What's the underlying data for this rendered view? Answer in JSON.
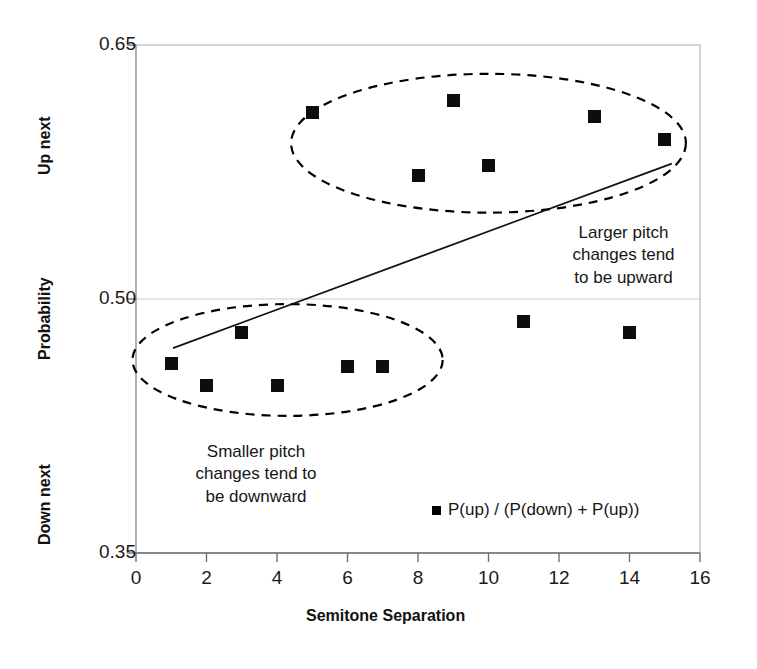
{
  "chart_data": {
    "type": "scatter",
    "title": "",
    "xlabel": "Semitone Separation",
    "ylabel": "Probability",
    "xlim": [
      0,
      16
    ],
    "ylim": [
      0.35,
      0.65
    ],
    "xticks": [
      "0",
      "2",
      "4",
      "6",
      "8",
      "10",
      "12",
      "14",
      "16"
    ],
    "xtick_values": [
      0,
      2,
      4,
      6,
      8,
      10,
      12,
      14,
      16
    ],
    "yticks": [
      "0.65",
      "0.50",
      "0.35"
    ],
    "ytick_values": [
      0.65,
      0.5,
      0.35
    ],
    "grid": "horizontal-gridline-at-0.50",
    "legend_position": "inside-bottom-center",
    "series": [
      {
        "name": "P(up) / (P(down) + P(up))",
        "marker": "filled-square",
        "color": "#0d0d0d",
        "x": [
          1,
          2,
          3,
          4,
          5,
          6,
          7,
          8,
          9,
          10,
          11,
          13,
          14,
          15
        ],
        "values": [
          0.462,
          0.449,
          0.48,
          0.449,
          0.61,
          0.46,
          0.46,
          0.573,
          0.617,
          0.579,
          0.487,
          0.608,
          0.48,
          0.594
        ]
      }
    ],
    "trendline": {
      "name": "linear-fit",
      "x_start": 1.05,
      "y_start": 0.471,
      "x_end": 15.2,
      "y_end": 0.58,
      "style": "solid-thin-black"
    },
    "axis_region_labels": {
      "top": "Up next",
      "middle": "Probability",
      "bottom": "Down next"
    },
    "annotations": [
      {
        "id": "upper-cluster-note",
        "text": "Larger pitch\nchanges tend\nto be upward",
        "x_data": 13.2,
        "y_data": 0.456
      },
      {
        "id": "lower-cluster-note",
        "text": "Smaller pitch\nchanges tend to\nbe downward",
        "x_data": 4.1,
        "y_data": 0.405
      }
    ],
    "ellipses": [
      {
        "id": "upper-cluster-ellipse",
        "center_x_data": 10.0,
        "center_y_data": 0.592,
        "rx_data": 5.6,
        "ry_data": 0.041,
        "style": "dashed",
        "encircles": "upper-group-of-points"
      },
      {
        "id": "lower-cluster-ellipse",
        "center_x_data": 4.3,
        "center_y_data": 0.464,
        "rx_data": 4.4,
        "ry_data": 0.033,
        "style": "dashed",
        "encircles": "lower-group-of-points"
      }
    ]
  },
  "legend": {
    "label": "P(up) / (P(down) + P(up))"
  }
}
